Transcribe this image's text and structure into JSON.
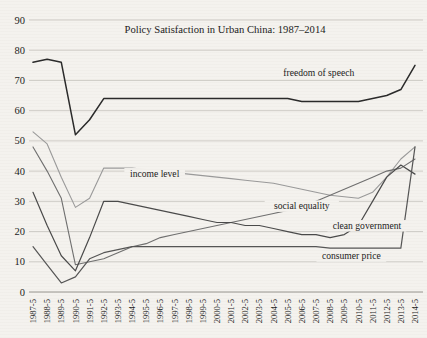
{
  "chart_data": {
    "type": "line",
    "title": "Policy Satisfaction in Urban China: 1987–2014",
    "xlabel": "",
    "ylabel": "",
    "ylim": [
      0,
      90
    ],
    "yticks": [
      0,
      10,
      20,
      30,
      40,
      50,
      60,
      70,
      80,
      90
    ],
    "grid": true,
    "legend_position": "inline-annotations",
    "categories": [
      "1987-5",
      "1988-5",
      "1989-5",
      "1990-5",
      "1991-5",
      "1992-5",
      "1993-5",
      "1994-5",
      "1995-5",
      "1996-5",
      "1997-5",
      "1998-5",
      "1999-5",
      "2000-5",
      "2001-5",
      "2002-5",
      "2003-5",
      "2004-5",
      "2005-5",
      "2006-5",
      "2007-5",
      "2008-5",
      "2009-5",
      "2010-5",
      "2011-5",
      "2012-5",
      "2013-5",
      "2014-5"
    ],
    "series": [
      {
        "name": "freedom of speech",
        "color": "#2a2a2a",
        "width": 1.5,
        "label_x_index": 20.2,
        "label_y": 71.5,
        "values": [
          76,
          77,
          76,
          52,
          57,
          64,
          64,
          64,
          64,
          64,
          64,
          64,
          64,
          64,
          64,
          64,
          64,
          64,
          64,
          63,
          63,
          63,
          63,
          63,
          64,
          65,
          67,
          75
        ]
      },
      {
        "name": "income level",
        "color": "#9a9a9a",
        "width": 1.1,
        "label_x_index": 8.6,
        "label_y": 38.2,
        "values": [
          53,
          49,
          38,
          28,
          31,
          41,
          41,
          41,
          40.5,
          40,
          39.5,
          39,
          38.5,
          38,
          37.5,
          37,
          36.5,
          36,
          35,
          34,
          33,
          32,
          31.5,
          31,
          33,
          38,
          44,
          48
        ]
      },
      {
        "name": "social equality",
        "color": "#6f6f6f",
        "width": 1.1,
        "label_x_index": 19.0,
        "label_y": 27.5,
        "values": [
          48,
          40,
          31,
          9,
          10,
          11,
          13,
          15,
          16,
          18,
          19,
          20,
          21,
          22,
          23,
          24,
          25,
          26,
          27,
          28,
          30,
          32,
          34,
          36,
          38,
          40,
          41,
          44
        ]
      },
      {
        "name": "clean government",
        "color": "#4a4a4a",
        "width": 1.2,
        "label_x_index": 23.6,
        "label_y": 21.0,
        "values": [
          33,
          22,
          12,
          7,
          18,
          30,
          30,
          29,
          28,
          27,
          26,
          25,
          24,
          23,
          23,
          22,
          22,
          21,
          20,
          19,
          19,
          18,
          19,
          22,
          30,
          38,
          42,
          39
        ]
      },
      {
        "name": "consumer price",
        "color": "#555555",
        "width": 1.2,
        "label_x_index": 22.5,
        "label_y": 11.0,
        "values": [
          15,
          9,
          3,
          5,
          11,
          13,
          14,
          15,
          15,
          15,
          15,
          15,
          15,
          15,
          15,
          15,
          15,
          15,
          15,
          15,
          15,
          14.5,
          14.5,
          14.5,
          14.5,
          14.5,
          14.5,
          48
        ]
      }
    ]
  }
}
